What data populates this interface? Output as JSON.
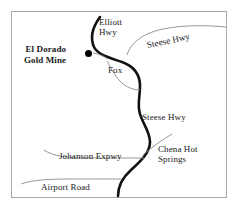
{
  "map": {
    "title": "El Dorado Gold Mine area road map",
    "frame": {
      "border_color": "#a8a8a8"
    },
    "marker": {
      "name": "El Dorado Gold Mine",
      "color": "#000000"
    },
    "labels": {
      "mine": "El Dorado\nGold Mine",
      "elliott_hwy": "Elliott\nHwy",
      "steese_hwy_top": "Steese Hwy",
      "fox": "Fox",
      "steese_hwy_mid": "Steese Hwy",
      "johanson_expwy": "Johanson Expwy",
      "chena_hot_springs": "Chena Hot\nSprings",
      "airport_road": "Airport Road"
    },
    "roads": {
      "main_highway_color": "#111111",
      "secondary_road_color": "#8a8a8a"
    }
  }
}
